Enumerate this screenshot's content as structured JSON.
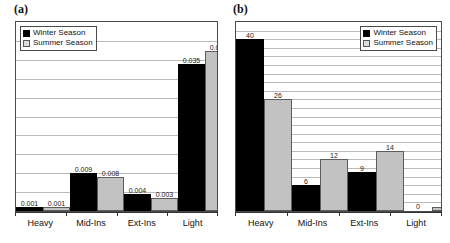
{
  "figure": {
    "panels": [
      {
        "label": "(a)",
        "legend_position": "top-left"
      },
      {
        "label": "(b)",
        "legend_position": "top-right"
      }
    ]
  },
  "legend": {
    "winter": "Winter Season",
    "summer": "Summer Season",
    "winter_icon": "black-square-swatch",
    "summer_icon": "gray-square-swatch"
  },
  "colors": {
    "winter": "#000000",
    "summer": "#c2c2c2",
    "gridline": "#b9b9b9",
    "frame": "#4a4a4a",
    "text": "#111111"
  },
  "chart_data": [
    {
      "type": "bar",
      "title": "(a)",
      "categories": [
        "Heavy",
        "Mid-Ins",
        "Ext-Ins",
        "Light"
      ],
      "series": [
        {
          "name": "Winter Season",
          "values": [
            0.001,
            0.009,
            0.004,
            0.035
          ]
        },
        {
          "name": "Summer Season",
          "values": [
            0.001,
            0.008,
            0.003,
            0.038
          ]
        }
      ],
      "value_labels": {
        "Winter Season": [
          "0.001",
          "0.009",
          "0.004",
          "0.035"
        ],
        "Summer Season": [
          "0.001",
          "0.008",
          "0.003",
          "0.038"
        ]
      },
      "xlabel": "",
      "ylabel": "",
      "ylim": [
        0,
        0.045
      ],
      "yticks": [],
      "gridlines": 9,
      "grid": true,
      "legend_position": "top-left"
    },
    {
      "type": "bar",
      "title": "(b)",
      "categories": [
        "Heavy",
        "Mid-Ins",
        "Ext-Ins",
        "Light"
      ],
      "series": [
        {
          "name": "Winter Season",
          "values": [
            40,
            6,
            9,
            0
          ]
        },
        {
          "name": "Summer Season",
          "values": [
            26,
            12,
            14,
            1
          ]
        }
      ],
      "value_labels": {
        "Winter Season": [
          "40",
          "6",
          "9",
          "0"
        ],
        "Summer Season": [
          "26",
          "12",
          "14",
          "1"
        ]
      },
      "xlabel": "",
      "ylabel": "",
      "ylim": [
        0,
        44
      ],
      "yticks": [],
      "gridlines": 21,
      "grid": true,
      "legend_position": "top-right"
    }
  ]
}
